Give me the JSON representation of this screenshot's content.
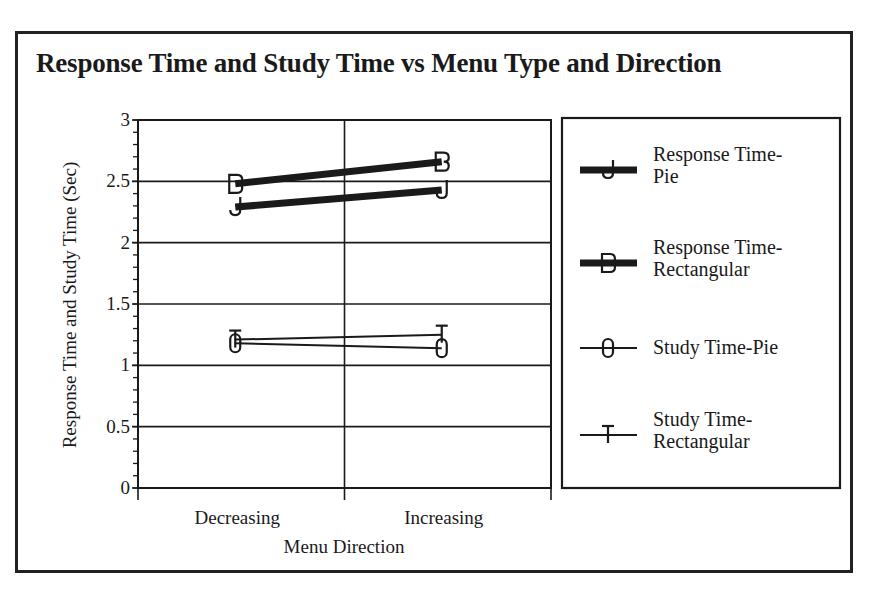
{
  "chart_data": {
    "type": "line",
    "title": "Response Time and Study Time vs Menu Type and Direction",
    "xlabel": "Menu Direction",
    "ylabel": "Response Time and Study Time (Sec)",
    "categories": [
      "Decreasing",
      "Increasing"
    ],
    "ylim": [
      0,
      3
    ],
    "yticks": [
      "0",
      "0.5",
      "1",
      "1.5",
      "2",
      "2.5",
      "3"
    ],
    "grid": true,
    "legend_position": "right",
    "series": [
      {
        "name": "Response Time-Pie",
        "legend_lines": [
          "Response Time-",
          "Pie"
        ],
        "marker": "J",
        "line_weight": "thick",
        "values": [
          2.29,
          2.43
        ]
      },
      {
        "name": "Response Time-Rectangular",
        "legend_lines": [
          "Response Time-",
          "Rectangular"
        ],
        "marker": "B",
        "line_weight": "thick",
        "values": [
          2.48,
          2.66
        ]
      },
      {
        "name": "Study Time-Pie",
        "legend_lines": [
          "Study Time-Pie"
        ],
        "marker": "0",
        "line_weight": "thin",
        "values": [
          1.18,
          1.14
        ]
      },
      {
        "name": "Study Time-Rectangular",
        "legend_lines": [
          "Study Time-",
          "Rectangular"
        ],
        "marker": "T",
        "line_weight": "thin",
        "values": [
          1.21,
          1.25
        ]
      }
    ]
  },
  "colors": {
    "ink": "#1a1a1a",
    "background": "#ffffff"
  }
}
